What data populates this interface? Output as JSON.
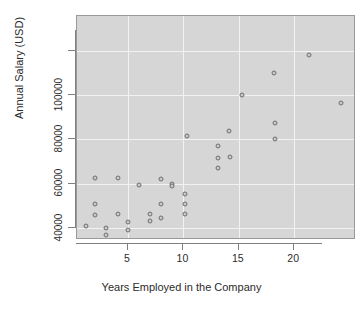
{
  "chart_data": {
    "type": "scatter",
    "title": "",
    "xlabel": "Years Employed in the Company",
    "ylabel": "Annual Salary (USD)",
    "xlim": [
      0.2,
      25.5
    ],
    "ylim": [
      34000,
      121000
    ],
    "xticks": [
      5,
      10,
      15,
      20
    ],
    "xtick_labels": [
      "5",
      "10",
      "15",
      "20"
    ],
    "yticks": [
      40000,
      60000,
      80000,
      100000
    ],
    "ytick_labels": [
      "40000",
      "60000",
      "80000",
      "100000"
    ],
    "grid": true,
    "grid_color": "#f2f2f2",
    "panel_color": "#d6d6d6",
    "point_fill": "#c9c9c9",
    "point_stroke": "#6f6f6f",
    "legend": null,
    "points": [
      {
        "x": 1.2,
        "y": 41000
      },
      {
        "x": 2.0,
        "y": 62500
      },
      {
        "x": 2.0,
        "y": 51000
      },
      {
        "x": 2.0,
        "y": 46000
      },
      {
        "x": 3.0,
        "y": 40000
      },
      {
        "x": 3.0,
        "y": 37000
      },
      {
        "x": 4.1,
        "y": 62500
      },
      {
        "x": 4.1,
        "y": 46500
      },
      {
        "x": 5.0,
        "y": 42500
      },
      {
        "x": 5.0,
        "y": 39000
      },
      {
        "x": 6.0,
        "y": 59500
      },
      {
        "x": 7.0,
        "y": 46500
      },
      {
        "x": 7.0,
        "y": 43000
      },
      {
        "x": 8.0,
        "y": 62000
      },
      {
        "x": 8.0,
        "y": 51000
      },
      {
        "x": 8.0,
        "y": 44500
      },
      {
        "x": 9.0,
        "y": 60000
      },
      {
        "x": 9.0,
        "y": 59000
      },
      {
        "x": 10.1,
        "y": 55500
      },
      {
        "x": 10.1,
        "y": 51000
      },
      {
        "x": 10.1,
        "y": 46500
      },
      {
        "x": 10.3,
        "y": 81500
      },
      {
        "x": 13.1,
        "y": 77000
      },
      {
        "x": 13.1,
        "y": 71500
      },
      {
        "x": 13.1,
        "y": 67000
      },
      {
        "x": 14.1,
        "y": 84000
      },
      {
        "x": 14.2,
        "y": 72000
      },
      {
        "x": 15.3,
        "y": 100000
      },
      {
        "x": 18.2,
        "y": 110000
      },
      {
        "x": 18.3,
        "y": 87500
      },
      {
        "x": 18.3,
        "y": 80000
      },
      {
        "x": 21.3,
        "y": 118000
      },
      {
        "x": 24.2,
        "y": 96500
      }
    ]
  }
}
